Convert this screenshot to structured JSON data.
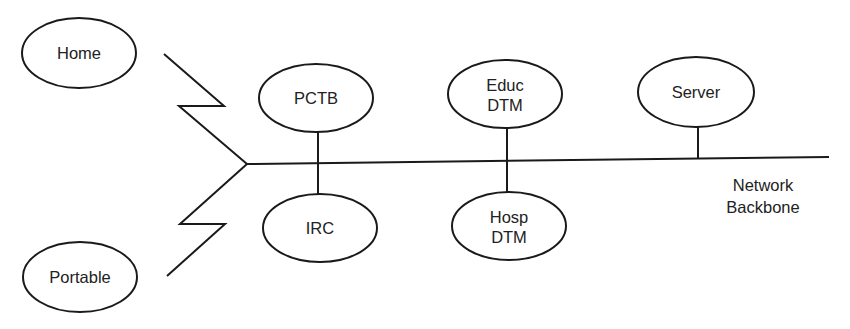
{
  "diagram": {
    "type": "network-topology",
    "colors": {
      "stroke": "#1a1a1a",
      "text": "#222222",
      "background": "#ffffff"
    },
    "backbone": {
      "label_lines": [
        "Network",
        "Backbone"
      ]
    },
    "nodes": {
      "home": {
        "lines": [
          "Home"
        ],
        "connection": "remote-link"
      },
      "portable": {
        "lines": [
          "Portable"
        ],
        "connection": "remote-link"
      },
      "pctb": {
        "lines": [
          "PCTB"
        ],
        "connection": "backbone"
      },
      "irc": {
        "lines": [
          "IRC"
        ],
        "connection": "backbone"
      },
      "educ_dtm": {
        "lines": [
          "Educ",
          "DTM"
        ],
        "connection": "backbone"
      },
      "hosp_dtm": {
        "lines": [
          "Hosp",
          "DTM"
        ],
        "connection": "backbone"
      },
      "server": {
        "lines": [
          "Server"
        ],
        "connection": "backbone"
      }
    }
  }
}
